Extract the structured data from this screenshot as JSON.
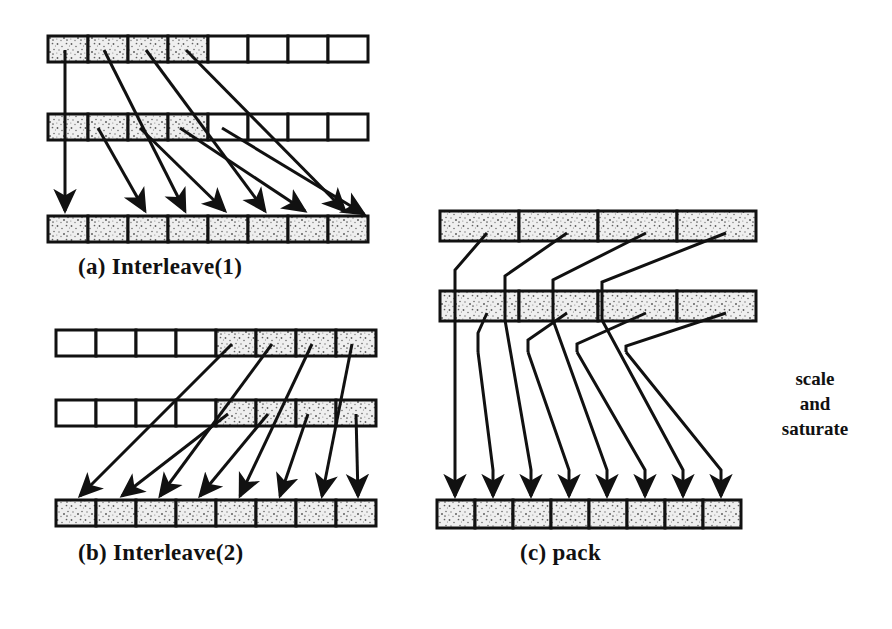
{
  "figure": {
    "background_color": "#ffffff",
    "ink_color": "#111111",
    "shaded_cell_color": "#d8d8d8",
    "empty_cell_color": "#ffffff"
  },
  "panels": [
    {
      "id": "a",
      "caption": "(a)  Interleave(1)",
      "rows": [
        {
          "name": "source-row-1",
          "cell_count": 8,
          "shaded": [
            true,
            true,
            true,
            true,
            false,
            false,
            false,
            false
          ]
        },
        {
          "name": "source-row-2",
          "cell_count": 8,
          "shaded": [
            true,
            true,
            true,
            true,
            false,
            false,
            false,
            false
          ]
        },
        {
          "name": "destination-row",
          "cell_count": 8,
          "shaded": [
            true,
            true,
            true,
            true,
            true,
            true,
            true,
            true
          ]
        }
      ],
      "mapping_note": "low halves interleaved element by element into the destination"
    },
    {
      "id": "b",
      "caption": "(b)  Interleave(2)",
      "rows": [
        {
          "name": "source-row-1",
          "cell_count": 8,
          "shaded": [
            false,
            false,
            false,
            false,
            true,
            true,
            true,
            true
          ]
        },
        {
          "name": "source-row-2",
          "cell_count": 8,
          "shaded": [
            false,
            false,
            false,
            false,
            true,
            true,
            true,
            true
          ]
        },
        {
          "name": "destination-row",
          "cell_count": 8,
          "shaded": [
            true,
            true,
            true,
            true,
            true,
            true,
            true,
            true
          ]
        }
      ],
      "mapping_note": "high halves interleaved element by element into the destination"
    },
    {
      "id": "c",
      "caption": "(c)  pack",
      "rows": [
        {
          "name": "source-row-1",
          "cell_count": 4,
          "shaded": [
            true,
            true,
            true,
            true
          ]
        },
        {
          "name": "source-row-2",
          "cell_count": 4,
          "shaded": [
            true,
            true,
            true,
            true
          ]
        },
        {
          "name": "destination-row",
          "cell_count": 8,
          "shaded": [
            true,
            true,
            true,
            true,
            true,
            true,
            true,
            true
          ]
        }
      ],
      "mapping_note": "wide elements narrowed and concatenated into one register"
    }
  ],
  "annotations": {
    "scale_and_saturate": {
      "line1": "scale",
      "line2": "and",
      "line3": "saturate"
    }
  }
}
